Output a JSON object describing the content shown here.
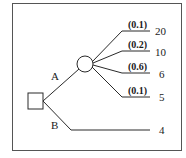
{
  "diagram": {
    "type": "decision-tree",
    "frame_color": "#555555",
    "line_color": "#2a2a2a",
    "decision_node": {
      "shape": "square",
      "branches": [
        {
          "label": "A",
          "leads_to": "chance-node",
          "outcomes": [
            {
              "probability": "(0.1)",
              "payoff": "20"
            },
            {
              "probability": "(0.2)",
              "payoff": "10"
            },
            {
              "probability": "(0.6)",
              "payoff": "6"
            },
            {
              "probability": "(0.1)",
              "payoff": "5"
            }
          ]
        },
        {
          "label": "B",
          "leads_to": "terminal",
          "payoff": "4"
        }
      ]
    }
  }
}
